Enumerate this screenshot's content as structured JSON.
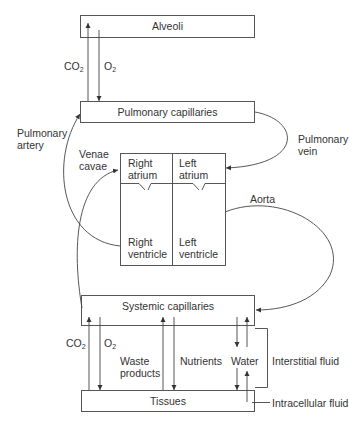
{
  "boxes": {
    "alveoli": "Alveoli",
    "pulmonary_capillaries": "Pulmonary capillaries",
    "systemic_capillaries": "Systemic capillaries",
    "tissues": "Tissues"
  },
  "heart": {
    "right_atrium": [
      "Right",
      "atrium"
    ],
    "left_atrium": [
      "Left",
      "atrium"
    ],
    "right_ventricle": [
      "Right",
      "ventricle"
    ],
    "left_ventricle": [
      "Left",
      "ventricle"
    ]
  },
  "vessels": {
    "pulmonary_artery": [
      "Pulmonary",
      "artery"
    ],
    "pulmonary_vein": [
      "Pulmonary",
      "vein"
    ],
    "venae_cavae": [
      "Venae",
      "cavae"
    ],
    "aorta": "Aorta"
  },
  "gas_exchange_lungs": {
    "co2_base": "CO",
    "co2_sub": "2",
    "o2_base": "O",
    "o2_sub": "2"
  },
  "tissue_exchange": {
    "co2_base": "CO",
    "co2_sub": "2",
    "o2_base": "O",
    "o2_sub": "2",
    "waste": [
      "Waste",
      "products"
    ],
    "nutrients": "Nutrients",
    "water": "Water"
  },
  "fluid_labels": {
    "interstitial": "Interstitial fluid",
    "intracellular": "Intracellular fluid"
  },
  "colors": {
    "line": "#333333",
    "box_border": "#555555",
    "background": "#ffffff"
  }
}
